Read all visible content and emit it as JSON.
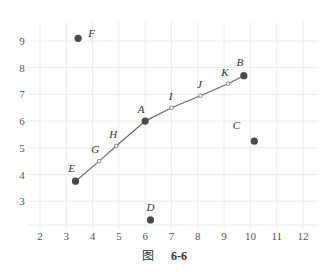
{
  "caption": {
    "prefix": "图",
    "number": "6-6"
  },
  "colors": {
    "grid": "#ececec",
    "point": "#4a4a4a",
    "line": "#6a6a6a",
    "small_point": "#888888",
    "label": "#333333",
    "tick": "#555555"
  },
  "chart_data": {
    "type": "scatter",
    "title": "",
    "xlabel": "",
    "ylabel": "",
    "xlim": [
      1.5,
      12.5
    ],
    "ylim": [
      2.1,
      9.6
    ],
    "x_ticks": [
      2,
      3,
      4,
      5,
      6,
      7,
      8,
      9,
      10,
      11,
      12
    ],
    "y_ticks": [
      3,
      4,
      5,
      6,
      7,
      8,
      9
    ],
    "grid": true,
    "legend": null,
    "points": [
      {
        "label": "A",
        "x": 6.0,
        "y": 6.0,
        "size": "large"
      },
      {
        "label": "B",
        "x": 9.75,
        "y": 7.7,
        "size": "large"
      },
      {
        "label": "C",
        "x": 10.15,
        "y": 5.25,
        "size": "large"
      },
      {
        "label": "D",
        "x": 6.2,
        "y": 2.3,
        "size": "large"
      },
      {
        "label": "E",
        "x": 3.35,
        "y": 3.75,
        "size": "large"
      },
      {
        "label": "F",
        "x": 3.45,
        "y": 9.1,
        "size": "large"
      },
      {
        "label": "G",
        "x": 4.25,
        "y": 4.5,
        "size": "small"
      },
      {
        "label": "H",
        "x": 4.9,
        "y": 5.07,
        "size": "small"
      },
      {
        "label": "I",
        "x": 7.0,
        "y": 6.5,
        "size": "small"
      },
      {
        "label": "J",
        "x": 8.1,
        "y": 6.95,
        "size": "small"
      },
      {
        "label": "K",
        "x": 9.15,
        "y": 7.4,
        "size": "small"
      }
    ],
    "path": [
      "E",
      "G",
      "H",
      "A",
      "I",
      "J",
      "K",
      "B"
    ]
  }
}
